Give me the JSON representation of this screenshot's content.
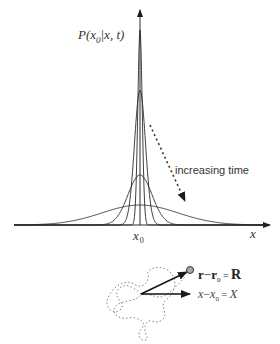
{
  "diagram": {
    "y_axis_label_main": "P(x",
    "y_axis_label_sub": "0",
    "y_axis_label_rest": "|x, t)",
    "x_axis_label": "x",
    "center_label_main": "x",
    "center_label_sub": "0",
    "annotation": "increasing time",
    "vector_R_label": {
      "lhs_a": "r",
      "minus": "−",
      "lhs_b": "r",
      "sub": "0",
      "eq": " = ",
      "rhs": "R"
    },
    "vector_X_label": {
      "lhs_a": "x",
      "minus": "−",
      "lhs_b": "x",
      "sub": "0",
      "eq": " = ",
      "rhs": "X"
    },
    "curves": [
      {
        "name": "narrowest",
        "sigma": 2.2,
        "peak_y": 30
      },
      {
        "name": "narrow",
        "sigma": 5.5,
        "peak_y": 90
      },
      {
        "name": "medium",
        "sigma": 12,
        "peak_y": 175
      },
      {
        "name": "wide",
        "sigma": 38,
        "peak_y": 205
      }
    ],
    "colors": {
      "ink": "#2a2a2a",
      "dashed": "#555555",
      "text": "#333333"
    }
  }
}
